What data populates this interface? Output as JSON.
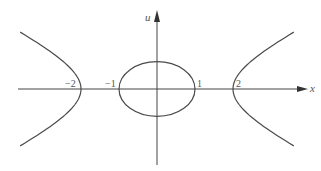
{
  "diagram": {
    "x_axis": {
      "label": "x",
      "range": [
        -4.0,
        3.9
      ]
    },
    "u_axis": {
      "label": "u",
      "range": [
        -2.0,
        2.0
      ]
    },
    "tick_labels": [
      {
        "value": -2,
        "text": "−2"
      },
      {
        "value": -1,
        "text": "−1"
      },
      {
        "value": 1,
        "text": "1"
      },
      {
        "value": 2,
        "text": "2"
      }
    ],
    "curves": [
      {
        "name": "ellipse",
        "type": "ellipse",
        "center": [
          0,
          0
        ],
        "semi_axis_x": 1,
        "semi_axis_u": 0.72
      },
      {
        "name": "hyperbola-right",
        "type": "hyperbola-branch",
        "vertex_x": 2,
        "branch": "right",
        "x_extent": 3.6
      },
      {
        "name": "hyperbola-left",
        "type": "hyperbola-branch",
        "vertex_x": -2,
        "branch": "left",
        "x_extent": -3.6
      }
    ]
  }
}
